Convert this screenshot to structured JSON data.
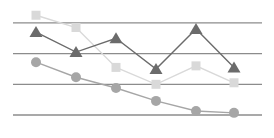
{
  "chart_data": {
    "type": "line",
    "title": "",
    "xlabel": "",
    "ylabel": "",
    "categories": [
      "1",
      "2",
      "3",
      "4",
      "5",
      "6"
    ],
    "ylim": [
      0,
      3.5
    ],
    "yticks": [
      0,
      1,
      2,
      3
    ],
    "grid": true,
    "legend": "none",
    "series": [
      {
        "name": "Series A",
        "marker": "triangle",
        "color": "#6b6b6b",
        "values": [
          2.7,
          2.05,
          2.5,
          1.5,
          2.8,
          1.55
        ]
      },
      {
        "name": "Series B",
        "marker": "square",
        "color": "#d9d9d9",
        "values": [
          3.25,
          2.85,
          1.55,
          1.0,
          1.6,
          1.05
        ]
      },
      {
        "name": "Series C",
        "marker": "circle",
        "color": "#a6a6a6",
        "values": [
          1.72,
          1.23,
          0.88,
          0.46,
          0.13,
          0.07
        ]
      }
    ]
  },
  "layout": {
    "plot_left": 13,
    "plot_right": 262,
    "y_zero_px": 115,
    "px_per_unit": 30.7,
    "x_positions": [
      36,
      76,
      116,
      156,
      196,
      234
    ]
  }
}
